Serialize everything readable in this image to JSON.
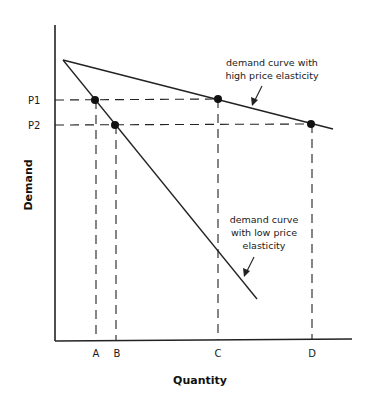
{
  "diagram": {
    "y_axis_title": "Demand",
    "x_axis_title": "Quantity",
    "price_labels": [
      {
        "label": "P1",
        "y": 100
      },
      {
        "label": "P2",
        "y": 125
      }
    ],
    "quantity_labels": [
      {
        "label": "A",
        "x": 96
      },
      {
        "label": "B",
        "x": 116
      },
      {
        "label": "C",
        "x": 218
      },
      {
        "label": "D",
        "x": 312
      }
    ],
    "curves": [
      {
        "name": "high price elasticity",
        "annotation": [
          "demand curve with",
          "high price elasticity"
        ],
        "points_on_curve": [
          "C",
          "D"
        ]
      },
      {
        "name": "low price elasticity",
        "annotation": [
          "demand curve",
          "with low price",
          "elasticity"
        ],
        "points_on_curve": [
          "A",
          "B"
        ]
      }
    ],
    "colors": {
      "line": "#222222",
      "background": "#ffffff"
    }
  }
}
